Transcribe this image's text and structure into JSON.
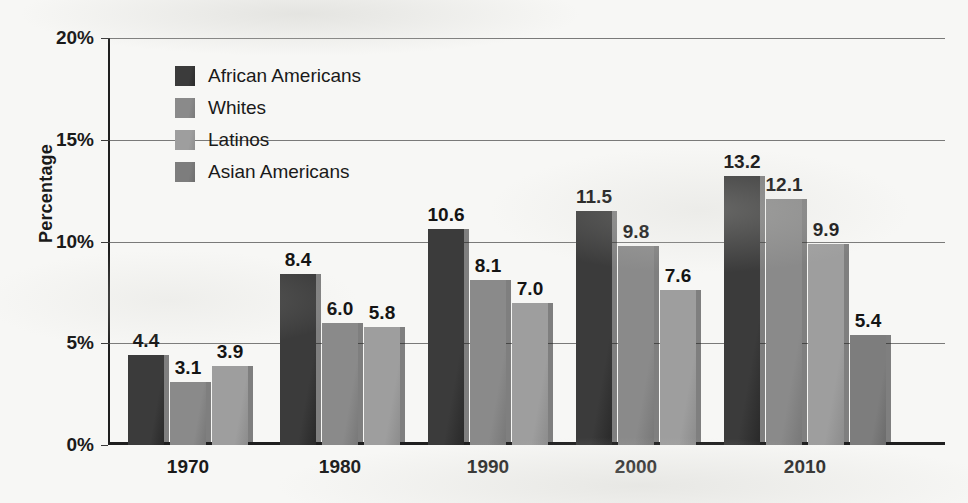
{
  "chart_data": {
    "type": "bar",
    "title": "",
    "subtitle": "",
    "xlabel": "",
    "ylabel": "Percentage",
    "categories": [
      "1970",
      "1980",
      "1990",
      "2000",
      "2010"
    ],
    "ylim": [
      0,
      20
    ],
    "ytick_values": [
      0,
      5,
      10,
      15,
      20
    ],
    "ytick_labels": [
      "0%",
      "5%",
      "10%",
      "15%",
      "20%"
    ],
    "grid": true,
    "grid_axis": "y",
    "legend_position": "upper-left-inside",
    "value_label_format": "one-decimal",
    "series": [
      {
        "name": "African Americans",
        "color": "#3b3b3b",
        "values": [
          4.4,
          8.4,
          10.6,
          11.5,
          13.2
        ],
        "labels": [
          "4.4",
          "8.4",
          "10.6",
          "11.5",
          "13.2"
        ]
      },
      {
        "name": "Whites",
        "color": "#8a8a8a",
        "values": [
          3.1,
          6.0,
          8.1,
          9.8,
          12.1
        ],
        "labels": [
          "3.1",
          "6.0",
          "8.1",
          "9.8",
          "12.1"
        ]
      },
      {
        "name": "Latinos",
        "color": "#9e9e9e",
        "values": [
          3.9,
          5.8,
          7.0,
          7.6,
          9.9
        ],
        "labels": [
          "3.9",
          "5.8",
          "7.0",
          "7.6",
          "9.9"
        ]
      },
      {
        "name": "Asian Americans",
        "color": "#7d7d7d",
        "values": [
          null,
          null,
          null,
          null,
          5.4
        ],
        "labels": [
          "",
          "",
          "",
          "",
          "5.4"
        ]
      }
    ]
  },
  "legend": {
    "items": [
      {
        "label": "African Americans",
        "color": "#3b3b3b"
      },
      {
        "label": "Whites",
        "color": "#8a8a8a"
      },
      {
        "label": "Latinos",
        "color": "#9e9e9e"
      },
      {
        "label": "Asian Americans",
        "color": "#7d7d7d"
      }
    ]
  },
  "axes": {
    "y_title": "Percentage",
    "y_ticks": [
      "20%",
      "15%",
      "10%",
      "5%",
      "0%"
    ],
    "x_ticks": [
      "1970",
      "1980",
      "1990",
      "2000",
      "2010"
    ]
  }
}
